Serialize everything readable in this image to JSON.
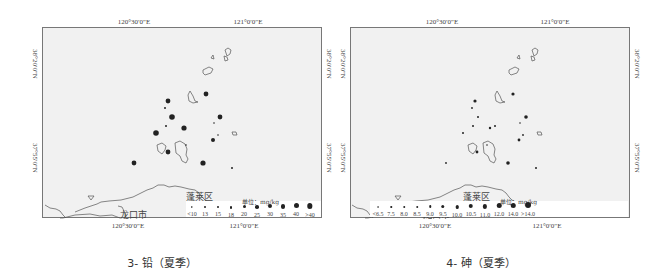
{
  "panels": [
    {
      "caption": "3- 铅（夏季）",
      "axes": {
        "top": [
          "120°30′0″E",
          "121°0′0″E"
        ],
        "bottom": [
          "120°30′0″E",
          "121°0′0″E"
        ],
        "left": [
          "38°20′0″N",
          "37°55′0″N"
        ],
        "right": [
          "38°20′0″N",
          "37°55′0″N"
        ]
      },
      "places": [
        "蓬莱区",
        "龙口市"
      ],
      "legend": {
        "title": "单位：mg/kg",
        "labels": [
          "<10",
          "13",
          "15",
          "18",
          "20",
          "25",
          "30",
          "35",
          "40",
          ">40"
        ]
      }
    },
    {
      "caption": "4- 砷（夏季）",
      "axes": {
        "top": [
          "120°30′0″E",
          "121°0′0″E"
        ],
        "bottom": [
          "120°30′0″E",
          "121°0′0″E"
        ],
        "left": [
          "38°20′0″N",
          "37°55′0″N"
        ],
        "right": [
          "38°20′0″N",
          "37°55′0″N"
        ]
      },
      "places": [
        "蓬莱区",
        "龙口市"
      ],
      "legend": {
        "title": "单位：mg/kg",
        "labels": [
          "<6.5",
          "7.5",
          "8.0",
          "8.5",
          "9.0",
          "9.5",
          "10.0",
          "10.5",
          "11.0",
          "12.0",
          "14.0",
          ">14.0"
        ]
      }
    }
  ],
  "colors": {
    "frame_bg": "#f1f1f1",
    "frame_border": "#777777",
    "dot": "#222222",
    "coast": "#555555"
  }
}
